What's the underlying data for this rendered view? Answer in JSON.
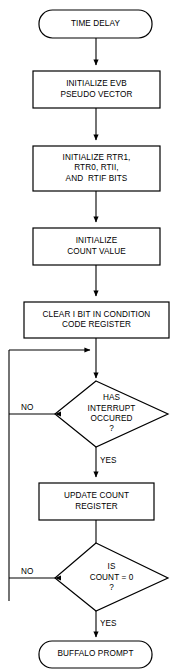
{
  "diagram": {
    "type": "flowchart",
    "title": "TIME DELAY",
    "orientation": "top-to-bottom",
    "colors": {
      "background": "#ffffff",
      "stroke": "#000000",
      "fill": "#ffffff",
      "text": "#000000"
    },
    "nodes": [
      {
        "id": "start",
        "shape": "terminator",
        "lines": [
          "TIME DELAY"
        ],
        "text": "TIME DELAY"
      },
      {
        "id": "init-evb",
        "shape": "process",
        "lines": [
          "INITIALIZE EVB",
          "PSEUDO VECTOR"
        ],
        "text": "INITIALIZE EVB PSEUDO VECTOR"
      },
      {
        "id": "init-bits",
        "shape": "process",
        "lines": [
          "INITIALIZE RTR1,",
          "RTR0, RTII,",
          "AND  RTIF BITS"
        ],
        "text": "INITIALIZE RTR1, RTR0, RTII, AND RTIF BITS"
      },
      {
        "id": "init-count",
        "shape": "process",
        "lines": [
          "INITIALIZE",
          "COUNT VALUE"
        ],
        "text": "INITIALIZE COUNT VALUE"
      },
      {
        "id": "clear-i-bit",
        "shape": "process",
        "lines": [
          "CLEAR I BIT IN CONDITION",
          "CODE REGISTER"
        ],
        "text": "CLEAR I BIT IN CONDITION CODE REGISTER"
      },
      {
        "id": "interrupt-check",
        "shape": "decision",
        "lines": [
          "HAS",
          "INTERRUPT",
          "OCCURED"
        ],
        "question_mark": "?",
        "text": "HAS INTERRUPT OCCURED ?"
      },
      {
        "id": "update-count",
        "shape": "process",
        "lines": [
          "UPDATE COUNT",
          "REGISTER"
        ],
        "text": "UPDATE COUNT REGISTER"
      },
      {
        "id": "count-check",
        "shape": "decision",
        "lines": [
          "IS",
          "COUNT = 0"
        ],
        "question_mark": "?",
        "text": "IS COUNT = 0 ?"
      },
      {
        "id": "end",
        "shape": "terminator",
        "lines": [
          "BUFFALO PROMPT"
        ],
        "text": "BUFFALO PROMPT"
      }
    ],
    "edge_labels": {
      "interrupt_no": "NO",
      "interrupt_yes": "YES",
      "count_no": "NO",
      "count_yes": "YES"
    }
  }
}
